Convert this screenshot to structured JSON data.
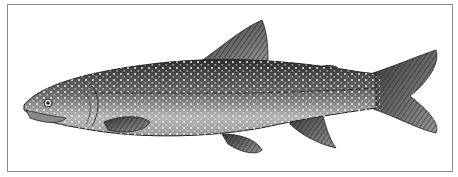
{
  "image": {
    "subject": "lake trout illustration",
    "background_color": "#ffffff",
    "frame_color": "#8a8a8a",
    "body_dark_color": "#3a3a3a",
    "body_light_color": "#c8c8c8",
    "spot_color": "#f2f2f2"
  }
}
